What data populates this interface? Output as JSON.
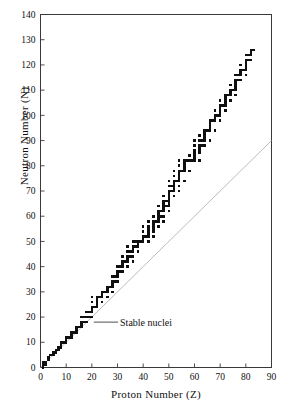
{
  "chart_data": {
    "type": "scatter",
    "title": "",
    "xlabel": "Proton Number (Z)",
    "ylabel": "Neutron Number (N)",
    "xlim": [
      0,
      90
    ],
    "ylim": [
      0,
      140
    ],
    "xticks": [
      0,
      10,
      20,
      30,
      40,
      50,
      60,
      70,
      80,
      90
    ],
    "yticks": [
      0,
      10,
      20,
      30,
      40,
      50,
      60,
      70,
      80,
      90,
      100,
      110,
      120,
      130,
      140
    ],
    "grid": false,
    "legend": "none",
    "marker_color": "#101010",
    "marker_shape": "square",
    "series": [
      {
        "name": "Stable nuclei",
        "marker": "square",
        "color": "#101010",
        "points": [
          [
            1,
            0
          ],
          [
            1,
            1
          ],
          [
            1,
            2
          ],
          [
            2,
            1
          ],
          [
            2,
            2
          ],
          [
            3,
            3
          ],
          [
            3,
            4
          ],
          [
            4,
            5
          ],
          [
            5,
            5
          ],
          [
            5,
            6
          ],
          [
            6,
            6
          ],
          [
            6,
            7
          ],
          [
            7,
            7
          ],
          [
            7,
            8
          ],
          [
            8,
            8
          ],
          [
            8,
            9
          ],
          [
            8,
            10
          ],
          [
            9,
            10
          ],
          [
            10,
            10
          ],
          [
            10,
            11
          ],
          [
            10,
            12
          ],
          [
            11,
            12
          ],
          [
            12,
            12
          ],
          [
            12,
            13
          ],
          [
            12,
            14
          ],
          [
            13,
            14
          ],
          [
            14,
            14
          ],
          [
            14,
            15
          ],
          [
            14,
            16
          ],
          [
            15,
            16
          ],
          [
            16,
            16
          ],
          [
            16,
            17
          ],
          [
            16,
            18
          ],
          [
            16,
            20
          ],
          [
            17,
            18
          ],
          [
            17,
            20
          ],
          [
            18,
            18
          ],
          [
            18,
            20
          ],
          [
            18,
            22
          ],
          [
            19,
            20
          ],
          [
            19,
            22
          ],
          [
            20,
            20
          ],
          [
            20,
            22
          ],
          [
            20,
            23
          ],
          [
            20,
            24
          ],
          [
            20,
            26
          ],
          [
            20,
            28
          ],
          [
            21,
            24
          ],
          [
            22,
            24
          ],
          [
            22,
            25
          ],
          [
            22,
            26
          ],
          [
            22,
            27
          ],
          [
            22,
            28
          ],
          [
            23,
            28
          ],
          [
            24,
            26
          ],
          [
            24,
            28
          ],
          [
            24,
            29
          ],
          [
            24,
            30
          ],
          [
            25,
            30
          ],
          [
            26,
            28
          ],
          [
            26,
            30
          ],
          [
            26,
            31
          ],
          [
            26,
            32
          ],
          [
            27,
            32
          ],
          [
            28,
            30
          ],
          [
            28,
            32
          ],
          [
            28,
            33
          ],
          [
            28,
            34
          ],
          [
            28,
            36
          ],
          [
            29,
            34
          ],
          [
            29,
            36
          ],
          [
            30,
            34
          ],
          [
            30,
            36
          ],
          [
            30,
            37
          ],
          [
            30,
            38
          ],
          [
            30,
            40
          ],
          [
            31,
            38
          ],
          [
            31,
            40
          ],
          [
            32,
            38
          ],
          [
            32,
            40
          ],
          [
            32,
            41
          ],
          [
            32,
            42
          ],
          [
            32,
            44
          ],
          [
            33,
            42
          ],
          [
            34,
            40
          ],
          [
            34,
            42
          ],
          [
            34,
            43
          ],
          [
            34,
            44
          ],
          [
            34,
            46
          ],
          [
            34,
            48
          ],
          [
            35,
            44
          ],
          [
            35,
            46
          ],
          [
            36,
            42
          ],
          [
            36,
            44
          ],
          [
            36,
            46
          ],
          [
            36,
            47
          ],
          [
            36,
            48
          ],
          [
            36,
            50
          ],
          [
            37,
            48
          ],
          [
            37,
            50
          ],
          [
            38,
            46
          ],
          [
            38,
            48
          ],
          [
            38,
            49
          ],
          [
            38,
            50
          ],
          [
            39,
            50
          ],
          [
            40,
            50
          ],
          [
            40,
            51
          ],
          [
            40,
            52
          ],
          [
            40,
            54
          ],
          [
            40,
            56
          ],
          [
            41,
            52
          ],
          [
            42,
            50
          ],
          [
            42,
            52
          ],
          [
            42,
            53
          ],
          [
            42,
            54
          ],
          [
            42,
            55
          ],
          [
            42,
            56
          ],
          [
            42,
            58
          ],
          [
            44,
            52
          ],
          [
            44,
            54
          ],
          [
            44,
            55
          ],
          [
            44,
            56
          ],
          [
            44,
            57
          ],
          [
            44,
            58
          ],
          [
            44,
            60
          ],
          [
            45,
            58
          ],
          [
            46,
            56
          ],
          [
            46,
            58
          ],
          [
            46,
            59
          ],
          [
            46,
            60
          ],
          [
            46,
            61
          ],
          [
            46,
            62
          ],
          [
            46,
            64
          ],
          [
            47,
            60
          ],
          [
            47,
            62
          ],
          [
            48,
            58
          ],
          [
            48,
            60
          ],
          [
            48,
            62
          ],
          [
            48,
            63
          ],
          [
            48,
            64
          ],
          [
            48,
            65
          ],
          [
            48,
            66
          ],
          [
            48,
            68
          ],
          [
            49,
            64
          ],
          [
            49,
            66
          ],
          [
            50,
            62
          ],
          [
            50,
            64
          ],
          [
            50,
            65
          ],
          [
            50,
            66
          ],
          [
            50,
            67
          ],
          [
            50,
            68
          ],
          [
            50,
            69
          ],
          [
            50,
            70
          ],
          [
            50,
            72
          ],
          [
            50,
            74
          ],
          [
            51,
            70
          ],
          [
            51,
            72
          ],
          [
            52,
            68
          ],
          [
            52,
            70
          ],
          [
            52,
            71
          ],
          [
            52,
            72
          ],
          [
            52,
            73
          ],
          [
            52,
            74
          ],
          [
            52,
            76
          ],
          [
            52,
            78
          ],
          [
            53,
            74
          ],
          [
            54,
            70
          ],
          [
            54,
            72
          ],
          [
            54,
            74
          ],
          [
            54,
            75
          ],
          [
            54,
            76
          ],
          [
            54,
            77
          ],
          [
            54,
            78
          ],
          [
            54,
            80
          ],
          [
            54,
            82
          ],
          [
            55,
            78
          ],
          [
            56,
            74
          ],
          [
            56,
            78
          ],
          [
            56,
            79
          ],
          [
            56,
            80
          ],
          [
            56,
            81
          ],
          [
            56,
            82
          ],
          [
            57,
            82
          ],
          [
            58,
            78
          ],
          [
            58,
            82
          ],
          [
            58,
            84
          ],
          [
            59,
            82
          ],
          [
            60,
            82
          ],
          [
            60,
            83
          ],
          [
            60,
            84
          ],
          [
            60,
            85
          ],
          [
            60,
            86
          ],
          [
            60,
            88
          ],
          [
            60,
            90
          ],
          [
            62,
            82
          ],
          [
            62,
            85
          ],
          [
            62,
            86
          ],
          [
            62,
            87
          ],
          [
            62,
            88
          ],
          [
            62,
            90
          ],
          [
            62,
            92
          ],
          [
            63,
            88
          ],
          [
            63,
            90
          ],
          [
            64,
            88
          ],
          [
            64,
            90
          ],
          [
            64,
            91
          ],
          [
            64,
            92
          ],
          [
            64,
            93
          ],
          [
            64,
            94
          ],
          [
            65,
            94
          ],
          [
            66,
            90
          ],
          [
            66,
            94
          ],
          [
            66,
            95
          ],
          [
            66,
            96
          ],
          [
            66,
            97
          ],
          [
            66,
            98
          ],
          [
            67,
            98
          ],
          [
            68,
            94
          ],
          [
            68,
            98
          ],
          [
            98,
            99
          ],
          [
            68,
            99
          ],
          [
            68,
            100
          ],
          [
            68,
            102
          ],
          [
            69,
            100
          ],
          [
            70,
            98
          ],
          [
            70,
            100
          ],
          [
            70,
            101
          ],
          [
            70,
            102
          ],
          [
            70,
            103
          ],
          [
            70,
            104
          ],
          [
            70,
            106
          ],
          [
            71,
            104
          ],
          [
            72,
            102
          ],
          [
            72,
            104
          ],
          [
            72,
            105
          ],
          [
            72,
            106
          ],
          [
            72,
            107
          ],
          [
            72,
            108
          ],
          [
            73,
            108
          ],
          [
            74,
            106
          ],
          [
            74,
            108
          ],
          [
            74,
            109
          ],
          [
            74,
            110
          ],
          [
            74,
            112
          ],
          [
            75,
            110
          ],
          [
            76,
            108
          ],
          [
            76,
            110
          ],
          [
            76,
            111
          ],
          [
            76,
            112
          ],
          [
            76,
            113
          ],
          [
            76,
            114
          ],
          [
            76,
            116
          ],
          [
            77,
            114
          ],
          [
            77,
            116
          ],
          [
            78,
            114
          ],
          [
            78,
            116
          ],
          [
            117,
            78
          ],
          [
            78,
            117
          ],
          [
            78,
            118
          ],
          [
            78,
            120
          ],
          [
            79,
            118
          ],
          [
            80,
            116
          ],
          [
            80,
            118
          ],
          [
            80,
            119
          ],
          [
            80,
            120
          ],
          [
            80,
            121
          ],
          [
            80,
            122
          ],
          [
            80,
            124
          ],
          [
            81,
            122
          ],
          [
            81,
            124
          ],
          [
            82,
            122
          ],
          [
            82,
            124
          ],
          [
            82,
            125
          ],
          [
            82,
            126
          ],
          [
            83,
            126
          ]
        ]
      }
    ],
    "reference_line": {
      "name": "N = Z",
      "color": "#b4b4b4",
      "from": [
        0,
        0
      ],
      "to": [
        90,
        90
      ]
    },
    "annotations": [
      {
        "name": "stable-nuclei-annotation",
        "text": "Stable nuclei",
        "point": [
          20,
          18
        ],
        "text_anchor": [
          31,
          18
        ]
      }
    ]
  },
  "axes": {
    "x_label": "Proton Number (Z)",
    "y_label": "Neutron Number (N)"
  }
}
